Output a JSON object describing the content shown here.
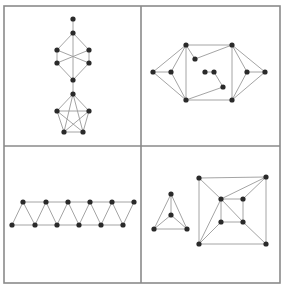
{
  "figure": {
    "colors": {
      "frame": "#8a8a8a",
      "edge": "#9a9a9a",
      "node": "#2a2a2a",
      "background": "#ffffff"
    },
    "frame": {
      "x": 4,
      "y": 6,
      "width": 276,
      "height": 277
    },
    "dividers": {
      "vertical_x": 141,
      "horizontal_y": 146
    },
    "panels": [
      {
        "name": "top-left-graph",
        "nodes": [
          [
            73,
            19
          ],
          [
            73,
            33
          ],
          [
            57,
            50
          ],
          [
            89,
            50
          ],
          [
            57,
            63
          ],
          [
            89,
            63
          ],
          [
            73,
            80
          ],
          [
            73,
            94
          ],
          [
            57,
            111
          ],
          [
            89,
            111
          ],
          [
            64,
            132
          ],
          [
            83,
            132
          ]
        ],
        "edges": [
          [
            0,
            1
          ],
          [
            1,
            2
          ],
          [
            1,
            3
          ],
          [
            2,
            4
          ],
          [
            3,
            5
          ],
          [
            4,
            6
          ],
          [
            5,
            6
          ],
          [
            1,
            6
          ],
          [
            2,
            5
          ],
          [
            3,
            4
          ],
          [
            6,
            7
          ],
          [
            7,
            8
          ],
          [
            7,
            9
          ],
          [
            8,
            10
          ],
          [
            9,
            11
          ],
          [
            10,
            11
          ],
          [
            8,
            9
          ],
          [
            7,
            10
          ],
          [
            7,
            11
          ],
          [
            8,
            11
          ],
          [
            9,
            10
          ]
        ]
      },
      {
        "name": "top-right-graph",
        "nodes": [
          [
            153,
            72
          ],
          [
            171,
            72
          ],
          [
            186,
            45
          ],
          [
            186,
            100
          ],
          [
            195,
            59
          ],
          [
            205,
            72
          ],
          [
            214,
            72
          ],
          [
            223,
            87
          ],
          [
            232,
            45
          ],
          [
            232,
            100
          ],
          [
            247,
            72
          ],
          [
            265,
            72
          ]
        ],
        "edges": [
          [
            0,
            1
          ],
          [
            0,
            2
          ],
          [
            0,
            3
          ],
          [
            1,
            2
          ],
          [
            1,
            3
          ],
          [
            2,
            3
          ],
          [
            2,
            8
          ],
          [
            3,
            9
          ],
          [
            2,
            4
          ],
          [
            4,
            8
          ],
          [
            5,
            6
          ],
          [
            6,
            7
          ],
          [
            7,
            3
          ],
          [
            8,
            9
          ],
          [
            8,
            10
          ],
          [
            8,
            11
          ],
          [
            9,
            10
          ],
          [
            9,
            11
          ],
          [
            10,
            11
          ]
        ]
      },
      {
        "name": "bottom-left-graph",
        "nodes": [
          [
            23,
            202
          ],
          [
            46,
            202
          ],
          [
            68,
            202
          ],
          [
            90,
            202
          ],
          [
            112,
            202
          ],
          [
            134,
            202
          ],
          [
            12,
            225
          ],
          [
            35,
            225
          ],
          [
            57,
            225
          ],
          [
            79,
            225
          ],
          [
            101,
            225
          ],
          [
            123,
            225
          ]
        ],
        "edges": [
          [
            0,
            1
          ],
          [
            1,
            2
          ],
          [
            2,
            3
          ],
          [
            3,
            4
          ],
          [
            4,
            5
          ],
          [
            6,
            7
          ],
          [
            7,
            8
          ],
          [
            8,
            9
          ],
          [
            9,
            10
          ],
          [
            10,
            11
          ],
          [
            6,
            0
          ],
          [
            0,
            7
          ],
          [
            7,
            1
          ],
          [
            1,
            8
          ],
          [
            8,
            2
          ],
          [
            2,
            9
          ],
          [
            9,
            3
          ],
          [
            3,
            10
          ],
          [
            10,
            4
          ],
          [
            4,
            11
          ],
          [
            11,
            5
          ]
        ]
      },
      {
        "name": "bottom-right-graph",
        "nodes": [
          [
            171,
            194
          ],
          [
            171,
            215
          ],
          [
            154,
            229
          ],
          [
            187,
            229
          ],
          [
            199,
            178
          ],
          [
            266,
            177
          ],
          [
            199,
            244
          ],
          [
            266,
            244
          ],
          [
            221,
            199
          ],
          [
            243,
            199
          ],
          [
            221,
            222
          ],
          [
            243,
            222
          ]
        ],
        "edges": [
          [
            0,
            1
          ],
          [
            0,
            2
          ],
          [
            0,
            3
          ],
          [
            1,
            2
          ],
          [
            1,
            3
          ],
          [
            2,
            3
          ],
          [
            4,
            5
          ],
          [
            5,
            7
          ],
          [
            7,
            6
          ],
          [
            6,
            4
          ],
          [
            8,
            9
          ],
          [
            9,
            11
          ],
          [
            11,
            10
          ],
          [
            10,
            8
          ],
          [
            4,
            8
          ],
          [
            8,
            5
          ],
          [
            9,
            5
          ],
          [
            6,
            8
          ],
          [
            6,
            10
          ],
          [
            8,
            11
          ],
          [
            11,
            7
          ]
        ]
      }
    ]
  }
}
